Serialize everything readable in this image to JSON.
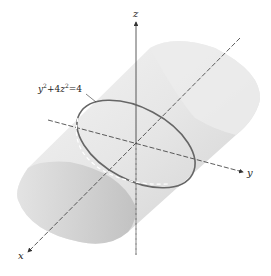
{
  "figure": {
    "type": "elliptic-cylinder-3d",
    "equation_label": "y² + 4z² = 4",
    "equation_parts": {
      "y": "y",
      "sup1": "2",
      "plus4": "+4",
      "z": "z",
      "sup2": "2",
      "eq4": "=4"
    },
    "axes": {
      "x": "x",
      "y": "y",
      "z": "z"
    },
    "colors": {
      "surface": "#e4e4e4",
      "surface_dark": "#c8c8c8",
      "ellipse": "#666666",
      "axis": "#333333"
    }
  }
}
